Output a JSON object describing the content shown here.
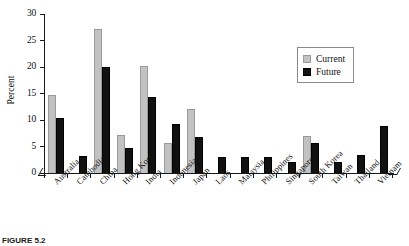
{
  "chart_data": {
    "type": "bar",
    "title": "",
    "xlabel": "",
    "ylabel": "Percent",
    "ylim": [
      0,
      30
    ],
    "yticks": [
      0,
      5,
      10,
      15,
      20,
      25,
      30
    ],
    "grid": false,
    "legend_position": "top-right",
    "categories": [
      "Australia",
      "Cambodia",
      "China",
      "Hong Kong",
      "India",
      "Indonesia",
      "Japan",
      "Laos",
      "Malaysia",
      "Philippines",
      "Singapore",
      "South Korea",
      "Taiwan",
      "Thailand",
      "Vietnam"
    ],
    "series": [
      {
        "name": "Current",
        "color": "#c2c2c2",
        "values": [
          14.8,
          0,
          27.2,
          7.2,
          20.1,
          5.6,
          12.1,
          0,
          0,
          0,
          0,
          7.0,
          0,
          0,
          0
        ]
      },
      {
        "name": "Future",
        "color": "#111111",
        "values": [
          10.4,
          3.2,
          20.0,
          4.8,
          14.3,
          9.2,
          6.8,
          3.0,
          3.0,
          3.0,
          2.0,
          5.6,
          2.0,
          3.4,
          8.9
        ]
      }
    ]
  },
  "legend": {
    "items": [
      {
        "label": "Current",
        "swatch": "current"
      },
      {
        "label": "Future",
        "swatch": "future"
      }
    ]
  },
  "caption": {
    "label": "FIGURE 5.2",
    "text": ""
  }
}
